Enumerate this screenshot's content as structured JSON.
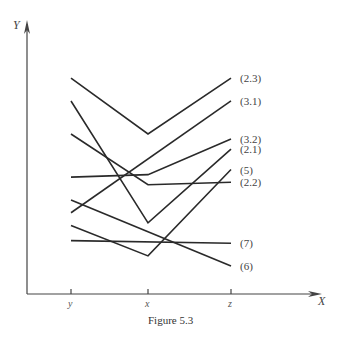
{
  "figure": {
    "caption": "Figure 5.3",
    "y_axis_label": "Y",
    "x_axis_label": "X",
    "x_ticks": [
      "y",
      "x",
      "z"
    ]
  },
  "chart_data": {
    "type": "line",
    "title": "Figure 5.3",
    "xlabel": "X",
    "ylabel": "Y",
    "categories": [
      "y",
      "x",
      "z"
    ],
    "ylim": [
      0,
      100
    ],
    "grid": false,
    "legend": "inline-right",
    "series": [
      {
        "name": "(2.3)",
        "values": [
          85,
          63,
          85
        ]
      },
      {
        "name": "(3.1)",
        "values": [
          32,
          null,
          76
        ]
      },
      {
        "name": "(3.2)",
        "values": [
          46,
          47,
          61
        ]
      },
      {
        "name": "(2.1)",
        "values": [
          76,
          28,
          57
        ]
      },
      {
        "name": "(5)",
        "values": [
          27,
          15,
          49
        ]
      },
      {
        "name": "(2.2)",
        "values": [
          63,
          43,
          44
        ]
      },
      {
        "name": "(7)",
        "values": [
          21,
          null,
          20
        ]
      },
      {
        "name": "(6)",
        "values": [
          37,
          null,
          11
        ]
      }
    ]
  }
}
